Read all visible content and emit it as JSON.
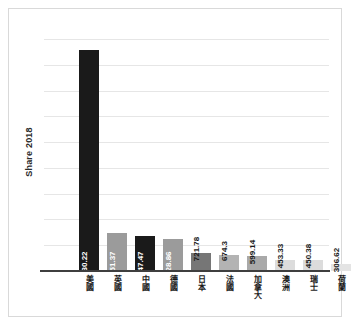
{
  "chart_data": {
    "type": "bar",
    "title": "",
    "xlabel": "",
    "ylabel": "Share 2018",
    "grid": true,
    "legend": false,
    "ylim": [
      0,
      9500
    ],
    "gridline_count": 9,
    "categories": [
      "美國",
      "英國",
      "中國",
      "德國",
      "日本",
      "法國",
      "加拿大",
      "澳洲",
      "瑞士",
      "荷蘭"
    ],
    "values": [
      9030.22,
      1551.37,
      1447.47,
      1328.86,
      721.78,
      674.3,
      599.14,
      453.33,
      450.38,
      306.62
    ],
    "value_labels": [
      "9,030.22",
      "1,551.37",
      "1,447.47",
      "1,328.86",
      "721.78",
      "674.3",
      "599.14",
      "453.33",
      "450.38",
      "306.62"
    ],
    "bar_colors": [
      "#1a1a1a",
      "#9b9b9b",
      "#1a1a1a",
      "#9b9b9b",
      "#767676",
      "#b3b3b3",
      "#a9a9a9",
      "#dcdcdc",
      "#dcdcdc",
      "#e4e4e4"
    ],
    "label_placement": [
      "inside",
      "inside",
      "inside",
      "inside",
      "outside",
      "outside",
      "outside",
      "outside",
      "outside",
      "outside"
    ]
  },
  "axis": {
    "y_title": "Share 2018"
  },
  "colors": {
    "frame": "#d9d9d9",
    "gridline": "#e6e6e6",
    "baseline": "#3f3f3f",
    "label_dark": "#1a1a1a",
    "label_light": "#ffffff"
  }
}
